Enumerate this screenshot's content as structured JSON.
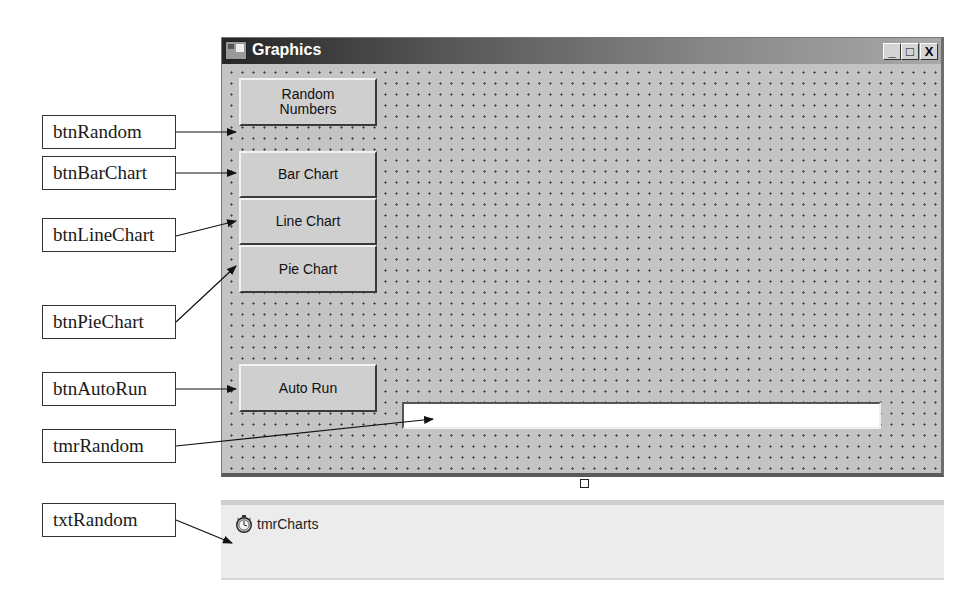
{
  "window": {
    "title": "Graphics",
    "caption_buttons": {
      "minimize": "_",
      "maximize": "□",
      "close": "X"
    }
  },
  "buttons": {
    "random_numbers": {
      "line1": "Random",
      "line2": "Numbers"
    },
    "bar_chart": "Bar Chart",
    "line_chart": "Line Chart",
    "pie_chart": "Pie Chart",
    "auto_run": "Auto Run"
  },
  "textbox": {
    "value": ""
  },
  "component_tray": {
    "items": [
      {
        "name": "tmrCharts",
        "icon": "stopwatch-icon"
      }
    ]
  },
  "callouts": [
    {
      "label": "btnRandom"
    },
    {
      "label": "btnBarChart"
    },
    {
      "label": "btnLineChart"
    },
    {
      "label": "btnPieChart"
    },
    {
      "label": "btnAutoRun"
    },
    {
      "label": "tmrRandom"
    },
    {
      "label": "txtRandom"
    }
  ]
}
